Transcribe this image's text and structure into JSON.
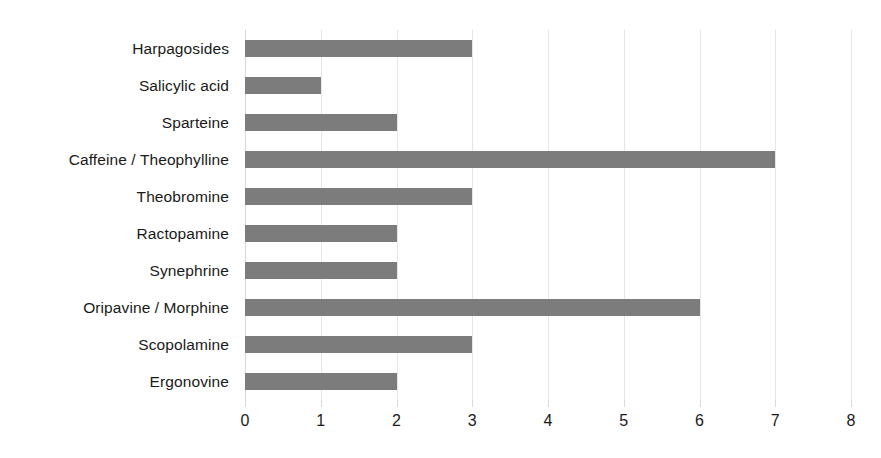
{
  "chart_data": {
    "type": "bar",
    "orientation": "horizontal",
    "title": "",
    "subtitle": "",
    "xlabel": "",
    "ylabel": "",
    "xlim": [
      0,
      8
    ],
    "ylim": null,
    "grid": true,
    "legend": false,
    "legend_position": "none",
    "bar_color": "#7c7c7c",
    "gridline_color": "#e6e6e6",
    "text_color": "#1a1a1a",
    "x_ticks": [
      "0",
      "1",
      "2",
      "3",
      "4",
      "5",
      "6",
      "7",
      "8"
    ],
    "x_tick_values": [
      0,
      1,
      2,
      3,
      4,
      5,
      6,
      7,
      8
    ],
    "categories": [
      "Harpagosides",
      "Salicylic acid",
      "Sparteine",
      "Caffeine / Theophylline",
      "Theobromine",
      "Ractopamine",
      "Synephrine",
      "Oripavine / Morphine",
      "Scopolamine",
      "Ergonovine"
    ],
    "values": [
      3,
      1,
      2,
      7,
      3,
      2,
      2,
      6,
      3,
      2
    ],
    "series": [
      {
        "name": "",
        "values": [
          3,
          1,
          2,
          7,
          3,
          2,
          2,
          6,
          3,
          2
        ]
      }
    ]
  },
  "page": {
    "bleed_text": ""
  }
}
